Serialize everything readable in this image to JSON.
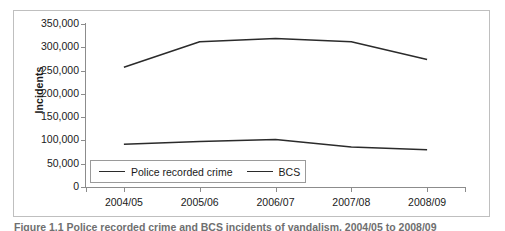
{
  "figure": {
    "caption": "Figure 1.1 Police recorded crime and BCS incidents of vandalism, 2004/05 to 2008/09"
  },
  "chart_data": {
    "type": "line",
    "title": "",
    "xlabel": "",
    "ylabel": "Incidents",
    "categories": [
      "2004/05",
      "2005/06",
      "2006/07",
      "2007/08",
      "2008/09"
    ],
    "series": [
      {
        "name": "Police recorded crime",
        "values": [
          92000,
          98000,
          102000,
          86000,
          80000
        ],
        "color": "#2b2b2b"
      },
      {
        "name": "BCS",
        "values": [
          257000,
          312000,
          319000,
          312000,
          274000
        ],
        "color": "#2b2b2b"
      }
    ],
    "ylim": [
      0,
      350000
    ],
    "ytick_values": [
      0,
      50000,
      100000,
      150000,
      200000,
      250000,
      300000,
      350000
    ],
    "ytick_labels": [
      "0",
      "50,000",
      "100,000",
      "150,000",
      "200,000",
      "250,000",
      "300,000",
      "350,000"
    ],
    "grid": false,
    "legend_position": "inside-bottom-left",
    "legend_entries": [
      "Police recorded crime",
      "BCS"
    ]
  },
  "axis": {
    "y_title": "Incidents"
  }
}
